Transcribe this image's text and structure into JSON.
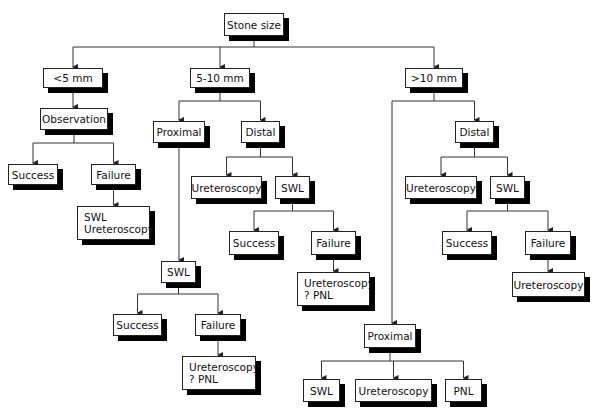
{
  "diagram": {
    "type": "flowchart",
    "nodes": [
      {
        "id": "root",
        "lines": [
          "Stone size"
        ],
        "x": 224,
        "y": 13,
        "w": 60,
        "h": 23
      },
      {
        "id": "lt5",
        "lines": [
          "<5 mm"
        ],
        "x": 43,
        "y": 68,
        "w": 60,
        "h": 20
      },
      {
        "id": "m510",
        "lines": [
          "5-10 mm"
        ],
        "x": 190,
        "y": 68,
        "w": 60,
        "h": 20
      },
      {
        "id": "gt10",
        "lines": [
          ">10 mm"
        ],
        "x": 405,
        "y": 68,
        "w": 58,
        "h": 20
      },
      {
        "id": "obs",
        "lines": [
          "Observation"
        ],
        "x": 40,
        "y": 108,
        "w": 68,
        "h": 22
      },
      {
        "id": "succ1",
        "lines": [
          "Success"
        ],
        "x": 8,
        "y": 164,
        "w": 50,
        "h": 21
      },
      {
        "id": "fail1",
        "lines": [
          "Failure"
        ],
        "x": 91,
        "y": 164,
        "w": 45,
        "h": 21
      },
      {
        "id": "swlu1",
        "lines": [
          "SWL",
          "Ureteroscopy"
        ],
        "x": 77,
        "y": 206,
        "w": 73,
        "h": 34,
        "multi": true
      },
      {
        "id": "prox1",
        "lines": [
          "Proximal"
        ],
        "x": 153,
        "y": 121,
        "w": 52,
        "h": 22
      },
      {
        "id": "dist1",
        "lines": [
          "Distal"
        ],
        "x": 241,
        "y": 121,
        "w": 39,
        "h": 22
      },
      {
        "id": "uret2",
        "lines": [
          "Ureteroscopy"
        ],
        "x": 191,
        "y": 176,
        "w": 71,
        "h": 23
      },
      {
        "id": "swl2",
        "lines": [
          "SWL"
        ],
        "x": 275,
        "y": 176,
        "w": 35,
        "h": 23
      },
      {
        "id": "succ2",
        "lines": [
          "Success"
        ],
        "x": 229,
        "y": 231,
        "w": 50,
        "h": 24
      },
      {
        "id": "fail2",
        "lines": [
          "Failure"
        ],
        "x": 311,
        "y": 231,
        "w": 45,
        "h": 24
      },
      {
        "id": "upnl2",
        "lines": [
          "Ureteroscopy",
          "? PNL"
        ],
        "x": 297,
        "y": 272,
        "w": 73,
        "h": 34,
        "multi": true
      },
      {
        "id": "swl3",
        "lines": [
          "SWL"
        ],
        "x": 161,
        "y": 261,
        "w": 35,
        "h": 22
      },
      {
        "id": "succ3",
        "lines": [
          "Success"
        ],
        "x": 113,
        "y": 314,
        "w": 49,
        "h": 22
      },
      {
        "id": "fail3",
        "lines": [
          "Failure"
        ],
        "x": 195,
        "y": 314,
        "w": 46,
        "h": 22
      },
      {
        "id": "upnl3",
        "lines": [
          "Ureteroscopy",
          "? PNL"
        ],
        "x": 182,
        "y": 356,
        "w": 74,
        "h": 34,
        "multi": true
      },
      {
        "id": "dist4",
        "lines": [
          "Distal"
        ],
        "x": 455,
        "y": 121,
        "w": 39,
        "h": 22
      },
      {
        "id": "uret4",
        "lines": [
          "Ureteroscopy"
        ],
        "x": 405,
        "y": 176,
        "w": 72,
        "h": 23
      },
      {
        "id": "swl4",
        "lines": [
          "SWL"
        ],
        "x": 490,
        "y": 176,
        "w": 35,
        "h": 23
      },
      {
        "id": "succ4",
        "lines": [
          "Success"
        ],
        "x": 442,
        "y": 231,
        "w": 50,
        "h": 24
      },
      {
        "id": "fail4",
        "lines": [
          "Failure"
        ],
        "x": 525,
        "y": 231,
        "w": 46,
        "h": 24
      },
      {
        "id": "uret5",
        "lines": [
          "Ureteroscopy"
        ],
        "x": 512,
        "y": 272,
        "w": 73,
        "h": 25
      },
      {
        "id": "prox5",
        "lines": [
          "Proximal"
        ],
        "x": 364,
        "y": 324,
        "w": 52,
        "h": 24
      },
      {
        "id": "swl6",
        "lines": [
          "SWL"
        ],
        "x": 303,
        "y": 379,
        "w": 37,
        "h": 23
      },
      {
        "id": "uret6",
        "lines": [
          "Ureteroscopy"
        ],
        "x": 355,
        "y": 379,
        "w": 77,
        "h": 23
      },
      {
        "id": "pnl6",
        "lines": [
          "PNL"
        ],
        "x": 445,
        "y": 379,
        "w": 37,
        "h": 23
      }
    ],
    "edges": [
      {
        "from": "root",
        "to": [
          "lt5",
          "m510",
          "gt10"
        ],
        "bus_y": 47
      },
      {
        "from": "lt5",
        "to": [
          "obs"
        ]
      },
      {
        "from": "obs",
        "to": [
          "succ1",
          "fail1"
        ],
        "bus_y": 143
      },
      {
        "from": "fail1",
        "to": [
          "swlu1"
        ]
      },
      {
        "from": "m510",
        "to": [
          "prox1",
          "dist1"
        ],
        "bus_y": 101
      },
      {
        "from": "prox1",
        "to": [
          "swl3"
        ]
      },
      {
        "from": "dist1",
        "to": [
          "uret2",
          "swl2"
        ],
        "bus_y": 157
      },
      {
        "from": "swl2",
        "to": [
          "succ2",
          "fail2"
        ],
        "bus_y": 211
      },
      {
        "from": "fail2",
        "to": [
          "upnl2"
        ]
      },
      {
        "from": "swl3",
        "to": [
          "succ3",
          "fail3"
        ],
        "bus_y": 294
      },
      {
        "from": "fail3",
        "to": [
          "upnl3"
        ]
      },
      {
        "from": "gt10",
        "to": [
          "prox5",
          "dist4"
        ],
        "bus_y": 101,
        "left_x": 392
      },
      {
        "from": "dist4",
        "to": [
          "uret4",
          "swl4"
        ],
        "bus_y": 157
      },
      {
        "from": "swl4",
        "to": [
          "succ4",
          "fail4"
        ],
        "bus_y": 211
      },
      {
        "from": "fail4",
        "to": [
          "uret5"
        ]
      },
      {
        "from": "prox5",
        "to": [
          "swl6",
          "uret6",
          "pnl6"
        ],
        "bus_y": 361
      }
    ]
  },
  "colors": {
    "line": "#222222",
    "shadow": "#000000",
    "box": "#ffffff"
  }
}
